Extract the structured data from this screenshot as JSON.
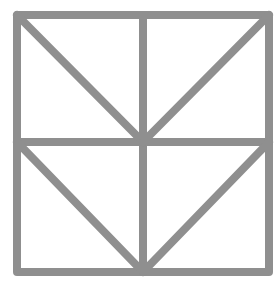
{
  "figure": {
    "stroke_color": "#8f8f8f",
    "background": "#ffffff",
    "stroke_width": 8,
    "outer_square": {
      "x1": 17,
      "y1": 15,
      "x2": 269,
      "y2": 272
    },
    "midlines": {
      "vertical_x": 143,
      "horizontal_y": 142
    },
    "diagonals": [
      {
        "name": "top-left-diagonal",
        "x1": 17,
        "y1": 15,
        "x2": 143,
        "y2": 142
      },
      {
        "name": "top-right-diagonal",
        "x1": 269,
        "y1": 15,
        "x2": 143,
        "y2": 142
      },
      {
        "name": "bottom-left-diagonal",
        "x1": 17,
        "y1": 142,
        "x2": 143,
        "y2": 272
      },
      {
        "name": "bottom-right-diagonal",
        "x1": 269,
        "y1": 142,
        "x2": 143,
        "y2": 272
      }
    ]
  }
}
